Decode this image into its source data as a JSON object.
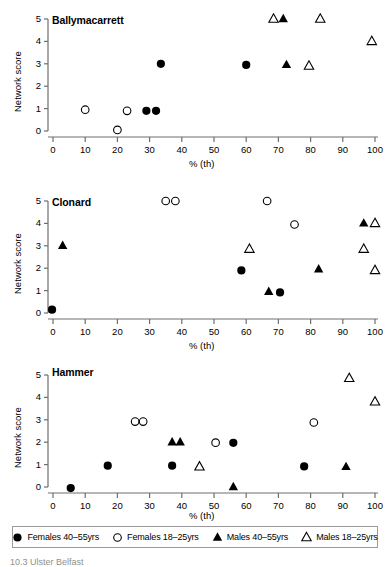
{
  "figure": {
    "caption_partial": "10.3  Ulster Belfast"
  },
  "axes": {
    "ylabel": "Network score",
    "xlabel": "% (th)",
    "y_ticks": [
      "0",
      "1",
      "2",
      "3",
      "4",
      "5"
    ],
    "x_ticks": [
      "0",
      "10",
      "20",
      "30",
      "40",
      "50",
      "60",
      "70",
      "80",
      "90",
      "100"
    ],
    "xlim": [
      -4,
      104
    ],
    "ylim": [
      -0.45,
      5.3
    ],
    "grid": false
  },
  "legend": {
    "position": "bottom",
    "items": [
      {
        "label": "Females 40–55yrs",
        "marker": "filled-circle",
        "series_key": "females_40_55"
      },
      {
        "label": "Females 18–25yrs",
        "marker": "open-circle",
        "series_key": "females_18_25"
      },
      {
        "label": "Males 40–55yrs",
        "marker": "filled-triangle",
        "series_key": "males_40_55"
      },
      {
        "label": "Males 18–25yrs",
        "marker": "open-triangle",
        "series_key": "males_18_25"
      }
    ]
  },
  "colors": {
    "ink": "#000000",
    "axis": "#6e6e6e",
    "legend_border": "#9a9a9a",
    "background": "#ffffff"
  },
  "chart_data": [
    {
      "type": "scatter",
      "title": "Ballymacarrett",
      "xlabel": "% (th)",
      "ylabel": "Network score",
      "xlim": [
        -4,
        104
      ],
      "ylim": [
        -0.45,
        5.3
      ],
      "grid": false,
      "series": [
        {
          "name": "Females 40–55yrs",
          "marker": "filled-circle",
          "points": [
            {
              "x": 29,
              "y": 0.9
            },
            {
              "x": 32,
              "y": 0.9
            },
            {
              "x": 33.5,
              "y": 3.0
            },
            {
              "x": 60,
              "y": 2.95
            }
          ]
        },
        {
          "name": "Females 18–25yrs",
          "marker": "open-circle",
          "points": [
            {
              "x": 10,
              "y": 0.95
            },
            {
              "x": 20,
              "y": 0.05
            },
            {
              "x": 23,
              "y": 0.9
            }
          ]
        },
        {
          "name": "Males 40–55yrs",
          "marker": "filled-triangle",
          "points": [
            {
              "x": 71.5,
              "y": 5.0
            },
            {
              "x": 72.5,
              "y": 2.95
            }
          ]
        },
        {
          "name": "Males 18–25yrs",
          "marker": "open-triangle",
          "points": [
            {
              "x": 68.5,
              "y": 5.0
            },
            {
              "x": 83,
              "y": 5.0
            },
            {
              "x": 79.5,
              "y": 2.9
            },
            {
              "x": 99,
              "y": 4.0
            }
          ]
        }
      ]
    },
    {
      "type": "scatter",
      "title": "Clonard",
      "xlabel": "% (th)",
      "ylabel": "Network score",
      "xlim": [
        -4,
        104
      ],
      "ylim": [
        -0.45,
        5.3
      ],
      "grid": false,
      "series": [
        {
          "name": "Females 40–55yrs",
          "marker": "filled-circle",
          "points": [
            {
              "x": -0.3,
              "y": 0.15
            },
            {
              "x": 58.5,
              "y": 1.9
            },
            {
              "x": 70.5,
              "y": 0.92
            }
          ]
        },
        {
          "name": "Females 18–25yrs",
          "marker": "open-circle",
          "points": [
            {
              "x": 35,
              "y": 5.0
            },
            {
              "x": 38,
              "y": 5.0
            },
            {
              "x": 66.5,
              "y": 5.0
            },
            {
              "x": 75,
              "y": 3.95
            }
          ]
        },
        {
          "name": "Males 40–55yrs",
          "marker": "filled-triangle",
          "points": [
            {
              "x": 3,
              "y": 3.0
            },
            {
              "x": 67,
              "y": 0.95
            },
            {
              "x": 82.5,
              "y": 1.95
            },
            {
              "x": 96.5,
              "y": 4.0
            }
          ]
        },
        {
          "name": "Males 18–25yrs",
          "marker": "open-triangle",
          "points": [
            {
              "x": 61,
              "y": 2.85
            },
            {
              "x": 96.5,
              "y": 2.85
            },
            {
              "x": 100,
              "y": 4.0
            },
            {
              "x": 100,
              "y": 1.9
            }
          ]
        }
      ]
    },
    {
      "type": "scatter",
      "title": "Hammer",
      "xlabel": "% (th)",
      "ylabel": "Network score",
      "xlim": [
        -4,
        104
      ],
      "ylim": [
        -0.45,
        5.3
      ],
      "grid": false,
      "series": [
        {
          "name": "Females 40–55yrs",
          "marker": "filled-circle",
          "points": [
            {
              "x": 5.5,
              "y": -0.05
            },
            {
              "x": 17,
              "y": 0.95
            },
            {
              "x": 37,
              "y": 0.95
            },
            {
              "x": 56,
              "y": 1.97
            },
            {
              "x": 78,
              "y": 0.92
            }
          ]
        },
        {
          "name": "Females 18–25yrs",
          "marker": "open-circle",
          "points": [
            {
              "x": 25.5,
              "y": 2.92
            },
            {
              "x": 28,
              "y": 2.92
            },
            {
              "x": 50.5,
              "y": 1.98
            },
            {
              "x": 81,
              "y": 2.88
            }
          ]
        },
        {
          "name": "Males 40–55yrs",
          "marker": "filled-triangle",
          "points": [
            {
              "x": 37,
              "y": 2.0
            },
            {
              "x": 39.5,
              "y": 2.0
            },
            {
              "x": 56,
              "y": 0.0
            },
            {
              "x": 91,
              "y": 0.9
            }
          ]
        },
        {
          "name": "Males 18–25yrs",
          "marker": "open-triangle",
          "points": [
            {
              "x": 45.5,
              "y": 0.9
            },
            {
              "x": 92,
              "y": 4.85
            },
            {
              "x": 100,
              "y": 3.8
            }
          ]
        }
      ]
    }
  ]
}
